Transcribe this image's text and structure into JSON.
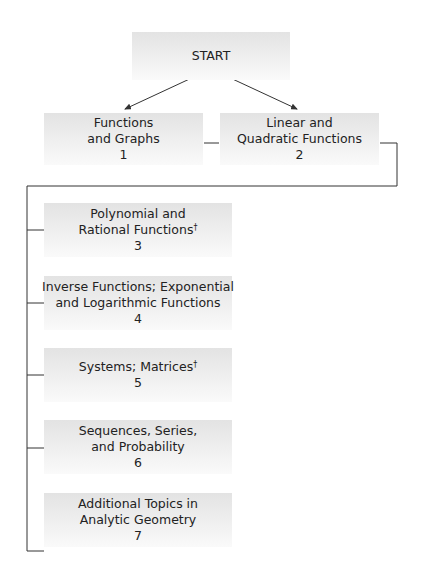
{
  "diagram": {
    "start": {
      "label": "START"
    },
    "nodes": [
      {
        "id": 1,
        "lines": [
          "Functions",
          "and Graphs"
        ],
        "number": "1"
      },
      {
        "id": 2,
        "lines": [
          "Linear and",
          "Quadratic Functions"
        ],
        "number": "2"
      },
      {
        "id": 3,
        "lines": [
          "Polynomial and",
          "Rational Functions"
        ],
        "dagger": "†",
        "number": "3"
      },
      {
        "id": 4,
        "lines": [
          "Inverse Functions; Exponential",
          "and Logarithmic Functions"
        ],
        "number": "4"
      },
      {
        "id": 5,
        "lines": [
          "Systems; Matrices"
        ],
        "dagger": "†",
        "number": "5"
      },
      {
        "id": 6,
        "lines": [
          "Sequences, Series,",
          "and Probability"
        ],
        "number": "6"
      },
      {
        "id": 7,
        "lines": [
          "Additional Topics in",
          "Analytic Geometry"
        ],
        "number": "7"
      }
    ],
    "edges": [
      {
        "from": "START",
        "to": 1,
        "type": "arrow"
      },
      {
        "from": "START",
        "to": 2,
        "type": "arrow"
      },
      {
        "from": 1,
        "to": 2,
        "type": "line"
      },
      {
        "from": 2,
        "to": [
          3,
          4,
          5,
          6,
          7
        ],
        "type": "bracket"
      }
    ]
  }
}
